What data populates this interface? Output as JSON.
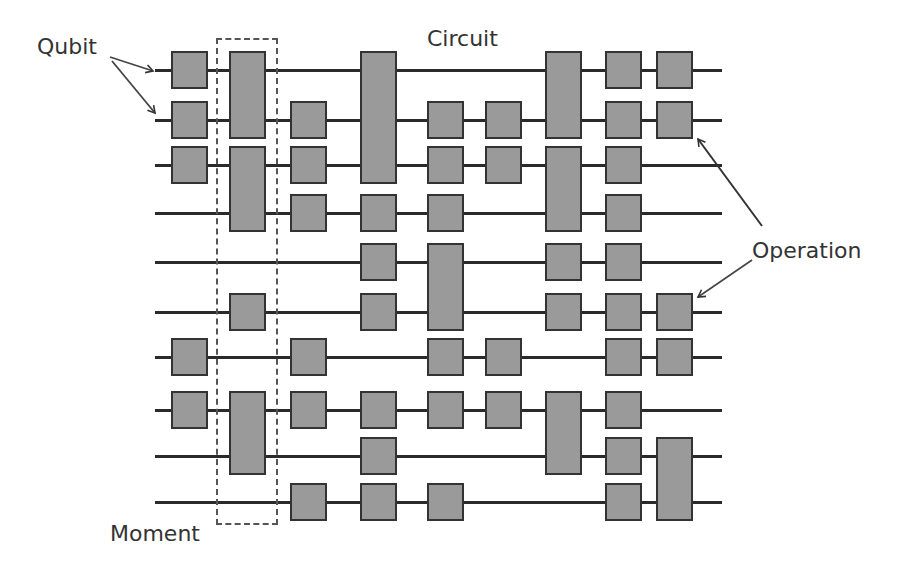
{
  "labels": {
    "qubit": "Qubit",
    "circuit": "Circuit",
    "operation": "Operation",
    "moment": "Moment"
  },
  "colors": {
    "gate_fill": "#9a9a9a",
    "gate_border": "#333333",
    "wire": "#2a2a2a",
    "text": "#333333"
  },
  "layout": {
    "wire_x_start": 155,
    "wire_x_end": 722,
    "gate_width": 37,
    "gate_height": 37,
    "rows_y": [
      70,
      120,
      165,
      213,
      262,
      312,
      357,
      410,
      456,
      502
    ],
    "columns_x": [
      171,
      229,
      290,
      360,
      427,
      485,
      545,
      605,
      656
    ]
  },
  "moment": {
    "column": 2,
    "x": 216,
    "y": 38,
    "width": 62,
    "height": 487
  },
  "gates": [
    {
      "col": 1,
      "rows": [
        1
      ]
    },
    {
      "col": 1,
      "rows": [
        2
      ]
    },
    {
      "col": 1,
      "rows": [
        3
      ]
    },
    {
      "col": 1,
      "rows": [
        7
      ]
    },
    {
      "col": 1,
      "rows": [
        8
      ]
    },
    {
      "col": 2,
      "rows": [
        1,
        2
      ]
    },
    {
      "col": 2,
      "rows": [
        3,
        4
      ]
    },
    {
      "col": 2,
      "rows": [
        6
      ]
    },
    {
      "col": 2,
      "rows": [
        8,
        9
      ]
    },
    {
      "col": 3,
      "rows": [
        2
      ]
    },
    {
      "col": 3,
      "rows": [
        3
      ]
    },
    {
      "col": 3,
      "rows": [
        4
      ]
    },
    {
      "col": 3,
      "rows": [
        7
      ]
    },
    {
      "col": 3,
      "rows": [
        8
      ]
    },
    {
      "col": 3,
      "rows": [
        10
      ]
    },
    {
      "col": 4,
      "rows": [
        1,
        2,
        3
      ]
    },
    {
      "col": 4,
      "rows": [
        4
      ]
    },
    {
      "col": 4,
      "rows": [
        5
      ]
    },
    {
      "col": 4,
      "rows": [
        6
      ]
    },
    {
      "col": 4,
      "rows": [
        8
      ]
    },
    {
      "col": 4,
      "rows": [
        9
      ]
    },
    {
      "col": 4,
      "rows": [
        10
      ]
    },
    {
      "col": 5,
      "rows": [
        2
      ]
    },
    {
      "col": 5,
      "rows": [
        3
      ]
    },
    {
      "col": 5,
      "rows": [
        4
      ]
    },
    {
      "col": 5,
      "rows": [
        5,
        6
      ]
    },
    {
      "col": 5,
      "rows": [
        7
      ]
    },
    {
      "col": 5,
      "rows": [
        8
      ]
    },
    {
      "col": 5,
      "rows": [
        10
      ]
    },
    {
      "col": 6,
      "rows": [
        2
      ]
    },
    {
      "col": 6,
      "rows": [
        3
      ]
    },
    {
      "col": 6,
      "rows": [
        7
      ]
    },
    {
      "col": 6,
      "rows": [
        8
      ]
    },
    {
      "col": 7,
      "rows": [
        1,
        2
      ]
    },
    {
      "col": 7,
      "rows": [
        3,
        4
      ]
    },
    {
      "col": 7,
      "rows": [
        5
      ]
    },
    {
      "col": 7,
      "rows": [
        6
      ]
    },
    {
      "col": 7,
      "rows": [
        8,
        9
      ]
    },
    {
      "col": 8,
      "rows": [
        1
      ]
    },
    {
      "col": 8,
      "rows": [
        2
      ]
    },
    {
      "col": 8,
      "rows": [
        3
      ]
    },
    {
      "col": 8,
      "rows": [
        4
      ]
    },
    {
      "col": 8,
      "rows": [
        5
      ]
    },
    {
      "col": 8,
      "rows": [
        6
      ]
    },
    {
      "col": 8,
      "rows": [
        7
      ]
    },
    {
      "col": 8,
      "rows": [
        8
      ]
    },
    {
      "col": 8,
      "rows": [
        9
      ]
    },
    {
      "col": 8,
      "rows": [
        10
      ]
    },
    {
      "col": 9,
      "rows": [
        1
      ]
    },
    {
      "col": 9,
      "rows": [
        2
      ]
    },
    {
      "col": 9,
      "rows": [
        6
      ]
    },
    {
      "col": 9,
      "rows": [
        7
      ]
    },
    {
      "col": 9,
      "rows": [
        9,
        10
      ]
    }
  ],
  "annotations": [
    {
      "label": "Qubit",
      "points_to": "wire row 1"
    },
    {
      "label": "Qubit",
      "points_to": "wire row 2"
    },
    {
      "label": "Operation",
      "points_to": "gate col 9 row 2"
    },
    {
      "label": "Operation",
      "points_to": "gate col 9 row 6"
    },
    {
      "label": "Moment",
      "points_to": "dashed column 2"
    }
  ]
}
